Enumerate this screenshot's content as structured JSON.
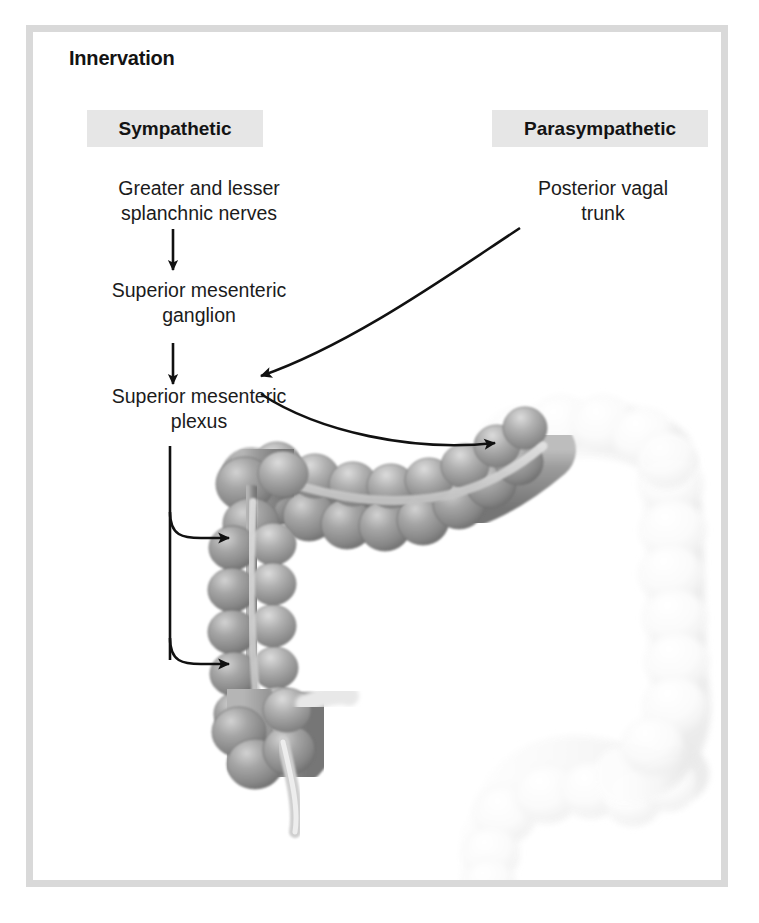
{
  "figure": {
    "title": "Innervation",
    "frame_color": "#d9d9d9",
    "header_bg": "#e6e6e6",
    "text_color": "#1b1b1b"
  },
  "columns": [
    {
      "id": "sympathetic",
      "label": "Sympathetic"
    },
    {
      "id": "parasympathetic",
      "label": "Parasympathetic"
    }
  ],
  "sympathetic_chain": [
    {
      "id": "splanchnic-nerves",
      "label": "Greater and lesser\nsplanchnic nerves"
    },
    {
      "id": "superior-mesenteric-ganglion",
      "label": "Superior mesenteric\nganglion"
    },
    {
      "id": "superior-mesenteric-plexus",
      "label": "Superior mesenteric\nplexus"
    }
  ],
  "parasympathetic_chain": [
    {
      "id": "posterior-vagal-trunk",
      "label": "Posterior vagal\ntrunk"
    }
  ],
  "labels": {
    "splanchnic_line1": "Greater and lesser",
    "splanchnic_line2": "splanchnic nerves",
    "ganglion_line1": "Superior mesenteric",
    "ganglion_line2": "ganglion",
    "plexus_line1": "Superior mesenteric",
    "plexus_line2": "plexus",
    "vagal_line1": "Posterior vagal",
    "vagal_line2": "trunk"
  },
  "arrows": [
    {
      "id": "splanchnic-to-ganglion",
      "kind": "straight-down",
      "from": "splanchnic nerves",
      "to": "superior mesenteric ganglion"
    },
    {
      "id": "ganglion-to-plexus",
      "kind": "straight-down",
      "from": "superior mesenteric ganglion",
      "to": "superior mesenteric plexus"
    },
    {
      "id": "vagal-to-plexus",
      "kind": "curved",
      "from": "posterior vagal trunk",
      "to": "superior mesenteric plexus"
    },
    {
      "id": "plexus-to-transverse-colon",
      "kind": "curved",
      "from": "superior mesenteric plexus",
      "to": "transverse colon"
    },
    {
      "id": "plexus-to-ascending-colon",
      "kind": "branch",
      "from": "superior mesenteric plexus",
      "to": "ascending colon"
    },
    {
      "id": "plexus-to-cecum",
      "kind": "branch",
      "from": "superior mesenteric plexus",
      "to": "cecum"
    }
  ],
  "illustration": {
    "subject": "large intestine (colon)",
    "highlighted_parts": [
      "cecum",
      "appendix",
      "ascending colon",
      "right colic flexure",
      "transverse colon"
    ],
    "faded_parts": [
      "left colic flexure",
      "descending colon",
      "sigmoid colon",
      "rectum"
    ],
    "highlight_color": "#8e8e8e",
    "faded_color": "#f2f2f2"
  }
}
